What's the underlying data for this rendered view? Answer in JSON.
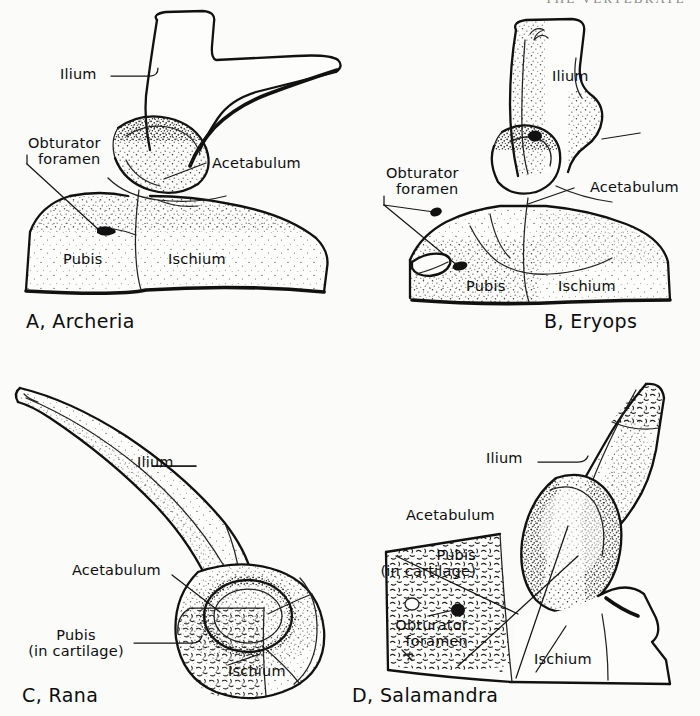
{
  "running_head": "THE VERTEBRATE",
  "figure": {
    "kind": "anatomical-line-drawing-plate",
    "view": "lateral (left side), ilium upper, pubis anterior-ventral, ischium posterior-ventral",
    "style": "pen-and-ink stipple shading on white, black leader lines"
  },
  "panels": [
    {
      "id": "A",
      "caption": "A, Archeria",
      "taxon": "Archeria",
      "labels": [
        {
          "name": "ilium",
          "text": "Ilium"
        },
        {
          "name": "obturator-foramen",
          "text": "Obturator",
          "text2": "foramen"
        },
        {
          "name": "acetabulum",
          "text": "Acetabulum"
        },
        {
          "name": "pubis",
          "text": "Pubis"
        },
        {
          "name": "ischium",
          "text": "Ischium"
        }
      ]
    },
    {
      "id": "B",
      "caption": "B, Eryops",
      "taxon": "Eryops",
      "labels": [
        {
          "name": "ilium",
          "text": "Ilium"
        },
        {
          "name": "obturator-foramen",
          "text": "Obturator",
          "text2": "foramen"
        },
        {
          "name": "acetabulum",
          "text": "Acetabulum"
        },
        {
          "name": "pubis",
          "text": "Pubis"
        },
        {
          "name": "ischium",
          "text": "Ischium"
        }
      ]
    },
    {
      "id": "C",
      "caption": "C, Rana",
      "taxon": "Rana",
      "labels": [
        {
          "name": "ilium",
          "text": "Ilium"
        },
        {
          "name": "acetabulum",
          "text": "Acetabulum"
        },
        {
          "name": "pubis",
          "text": "Pubis",
          "text2": "(in cartilage)"
        },
        {
          "name": "ischium",
          "text": "Ischium"
        }
      ]
    },
    {
      "id": "D",
      "caption": "D, Salamandra",
      "taxon": "Salamandra",
      "labels": [
        {
          "name": "ilium",
          "text": "Ilium"
        },
        {
          "name": "acetabulum",
          "text": "Acetabulum"
        },
        {
          "name": "pubis",
          "text": "Pubis",
          "text2": "(in cartilage)"
        },
        {
          "name": "obturator-foramen",
          "text": "Obturator",
          "text2": "foramen"
        },
        {
          "name": "ischium",
          "text": "Ischium"
        }
      ]
    }
  ],
  "colors": {
    "paper": "#fbfbfa",
    "ink": "#111111",
    "stipple": "#3a3a3a",
    "running_head": "#8a8a8a"
  }
}
